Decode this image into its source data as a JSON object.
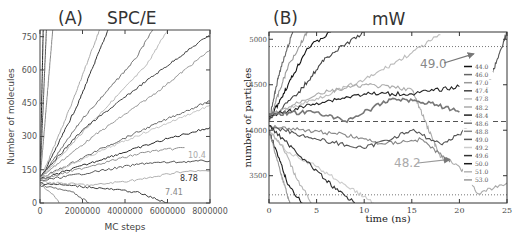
{
  "chart_data": [
    {
      "panel": "(A)",
      "title": "SPC/E",
      "type": "line",
      "xlabel": "MC steps",
      "ylabel": "Number of molecules",
      "xlim": [
        0,
        8000000
      ],
      "ylim": [
        0,
        780
      ],
      "xticks": [
        "0",
        "2000000",
        "4000000",
        "6000000",
        "8000000"
      ],
      "yticks": [
        "0",
        "150",
        "300",
        "450",
        "600",
        "750"
      ],
      "annotations": [
        "10.4",
        "8.78",
        "7.41"
      ],
      "series": [
        {
          "name": "fast-1",
          "x": [
            0,
            150000
          ],
          "y": [
            100,
            780
          ]
        },
        {
          "name": "fast-2",
          "x": [
            0,
            300000
          ],
          "y": [
            100,
            780
          ]
        },
        {
          "name": "fast-3",
          "x": [
            0,
            600000
          ],
          "y": [
            100,
            780
          ]
        },
        {
          "name": "fast-4",
          "x": [
            0,
            1500000,
            2800000
          ],
          "y": [
            100,
            450,
            780
          ]
        },
        {
          "name": "fast-5",
          "x": [
            0,
            1800000,
            3200000
          ],
          "y": [
            100,
            450,
            780
          ]
        },
        {
          "name": "mid-1",
          "x": [
            0,
            2000000,
            4500000,
            5300000
          ],
          "y": [
            110,
            380,
            650,
            780
          ]
        },
        {
          "name": "mid-2",
          "x": [
            0,
            2500000,
            5000000,
            6000000
          ],
          "y": [
            110,
            370,
            620,
            780
          ]
        },
        {
          "name": "mid-3",
          "x": [
            0,
            2000000,
            5000000,
            8000000
          ],
          "y": [
            120,
            330,
            550,
            760
          ]
        },
        {
          "name": "mid-4",
          "x": [
            0,
            2500000,
            5500000,
            8000000
          ],
          "y": [
            115,
            300,
            500,
            690
          ]
        },
        {
          "name": "slow-1",
          "x": [
            0,
            3000000,
            6000000,
            8000000
          ],
          "y": [
            110,
            250,
            380,
            460
          ]
        },
        {
          "name": "slow-2",
          "x": [
            0,
            3000000,
            6000000,
            8000000
          ],
          "y": [
            110,
            240,
            360,
            440
          ]
        },
        {
          "name": "slow-3",
          "x": [
            0,
            3000000,
            6000000,
            8000000
          ],
          "y": [
            105,
            200,
            290,
            340
          ]
        },
        {
          "name": "slow-4",
          "x": [
            0,
            2500000,
            5000000,
            6800000
          ],
          "y": [
            105,
            170,
            230,
            250
          ]
        },
        {
          "name": "10.4",
          "x": [
            0,
            2500000,
            5000000,
            8000000
          ],
          "y": [
            100,
            140,
            180,
            190
          ]
        },
        {
          "name": "8.78",
          "x": [
            0,
            2500000,
            5000000,
            6500000,
            8000000
          ],
          "y": [
            95,
            80,
            110,
            140,
            145
          ]
        },
        {
          "name": "7.41",
          "x": [
            0,
            2500000,
            4500000,
            6000000
          ],
          "y": [
            90,
            70,
            50,
            0
          ]
        },
        {
          "name": "decay-1",
          "x": [
            0,
            600000,
            900000
          ],
          "y": [
            85,
            40,
            0
          ]
        },
        {
          "name": "decay-2",
          "x": [
            0,
            1500000,
            2300000
          ],
          "y": [
            80,
            50,
            0
          ]
        }
      ]
    },
    {
      "panel": "(B)",
      "title": "mW",
      "type": "line",
      "xlabel": "time (ns)",
      "ylabel": "number of particles",
      "xlim": [
        0,
        25
      ],
      "ylim": [
        3200,
        5080
      ],
      "xticks": [
        "0",
        "5",
        "10",
        "15",
        "20",
        "25"
      ],
      "yticks": [
        "3500",
        "4000",
        "4500",
        "5000"
      ],
      "reference_lines": {
        "dashed": 4096,
        "dotted_upper": 4920,
        "dotted_lower": 3290
      },
      "annotations": [
        {
          "text": "49.0",
          "arrow_to": [
            21.5,
            4840
          ]
        },
        {
          "text": "48.2",
          "arrow_to": [
            19.0,
            3680
          ]
        }
      ],
      "legend": [
        "44.0",
        "46.0",
        "47.0",
        "47.4",
        "47.8",
        "48.2",
        "48.4",
        "48.6",
        "48.8",
        "49.0",
        "49.2",
        "49.6",
        "50.0",
        "51.0",
        "53.0"
      ],
      "legend_position": "right-inside",
      "series": [
        {
          "name": "44.0",
          "x": [
            0,
            2,
            4,
            6.5
          ],
          "y": [
            4100,
            4500,
            4900,
            5080
          ]
        },
        {
          "name": "46.0",
          "x": [
            0,
            1,
            2.5
          ],
          "y": [
            4100,
            4600,
            5080
          ]
        },
        {
          "name": "47.0",
          "x": [
            0,
            2,
            4
          ],
          "y": [
            4100,
            4700,
            5080
          ]
        },
        {
          "name": "47.4",
          "x": [
            0,
            3,
            6,
            10
          ],
          "y": [
            4120,
            4400,
            4800,
            5080
          ]
        },
        {
          "name": "47.8",
          "x": [
            0,
            5,
            10,
            15,
            18
          ],
          "y": [
            4150,
            4350,
            4550,
            4850,
            5050
          ]
        },
        {
          "name": "48.2",
          "x": [
            0,
            5,
            10,
            15,
            18,
            20,
            22,
            25
          ],
          "y": [
            4150,
            4400,
            4500,
            4450,
            3700,
            3600,
            3300,
            3420
          ]
        },
        {
          "name": "48.4",
          "x": [
            0,
            5,
            10,
            15,
            20
          ],
          "y": [
            4150,
            4300,
            4400,
            4400,
            4480
          ]
        },
        {
          "name": "48.6",
          "x": [
            0,
            5,
            8,
            13,
            17,
            20
          ],
          "y": [
            4180,
            4200,
            4100,
            4350,
            4300,
            4200
          ]
        },
        {
          "name": "48.8",
          "x": [
            0,
            4,
            8,
            12,
            16,
            19
          ],
          "y": [
            4050,
            4000,
            3950,
            3850,
            3900,
            3650
          ]
        },
        {
          "name": "49.0",
          "x": [
            0,
            5,
            10,
            15,
            18,
            20,
            22,
            25
          ],
          "y": [
            4050,
            3900,
            3800,
            4000,
            3850,
            3950,
            4200,
            5080
          ]
        },
        {
          "name": "49.2",
          "x": [
            0,
            2,
            5,
            8,
            11
          ],
          "y": [
            4000,
            3750,
            3600,
            3400,
            3200
          ]
        },
        {
          "name": "49.6",
          "x": [
            0,
            2,
            4,
            7,
            9
          ],
          "y": [
            4050,
            3850,
            3650,
            3350,
            3200
          ]
        },
        {
          "name": "50.0",
          "x": [
            0,
            1,
            2,
            3.5
          ],
          "y": [
            4000,
            3700,
            3400,
            3200
          ]
        },
        {
          "name": "51.0",
          "x": [
            0,
            1.5,
            3,
            4.5
          ],
          "y": [
            4000,
            3800,
            3450,
            3200
          ]
        },
        {
          "name": "53.0",
          "x": [
            0,
            0.8,
            1.6,
            2.2
          ],
          "y": [
            4000,
            3700,
            3400,
            3200
          ]
        }
      ]
    }
  ]
}
